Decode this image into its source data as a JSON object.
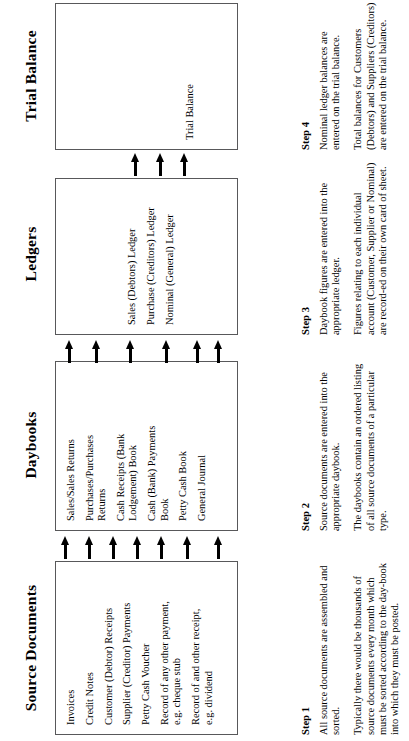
{
  "diagram": {
    "columns": [
      {
        "key": "source_documents",
        "heading": "Source Documents",
        "items": [
          "Invoices",
          "Credit Notes",
          "Customer (Debtor) Receipts",
          "Supplier (Creditor) Payments",
          "Petty Cash Voucher",
          "Record of any other payment,\ne.g. cheque stub",
          "Record of and other receipt,\ne.g. dividend"
        ],
        "step": {
          "label": "Step 1",
          "paragraphs": [
            "All source documents are assembled and sorted.",
            "Typically there would be thousands of source documents every month which must be sorted according to the day-book into which they must be posted."
          ]
        }
      },
      {
        "key": "daybooks",
        "heading": "Daybooks",
        "items": [
          "Sales/Sales Returns",
          "Purchases/Purchases\nReturns",
          "Cash Receipts (Bank\nLodgement) Book",
          "Cash (Bank) Payments\nBook",
          "Petty Cash Book",
          "General Journal"
        ],
        "step": {
          "label": "Step 2",
          "paragraphs": [
            "Source documents are entered into the appropriate daybook.",
            "The daybooks contain an ordered listing of all source documents of a particular type."
          ]
        }
      },
      {
        "key": "ledgers",
        "heading": "Ledgers",
        "items": [
          "Sales (Debtors) Ledger",
          "Purchase (Creditors) Ledger",
          "Nominal (General) Ledger"
        ],
        "step": {
          "label": "Step 3",
          "paragraphs": [
            "Daybook figures are entered into the appropriate ledger.",
            "Figures relating to each individual account (Customer, Supplier or Nominal) are record-ed on their own card of sheet."
          ]
        }
      },
      {
        "key": "trial_balance",
        "heading": "Trial Balance",
        "items": [
          "Trial Balance"
        ],
        "step": {
          "label": "Step 4",
          "paragraphs": [
            "Nominal ledger balances are entered on the trial balance.",
            "Total balances for Customers (Debtors) and Suppliers (Creditors) are entered on the trial balance."
          ]
        }
      }
    ],
    "flows": [
      {
        "key": "source-to-daybooks",
        "from": "source_documents",
        "to": "daybooks",
        "arrow_count": 7
      },
      {
        "key": "daybooks-to-ledgers",
        "from": "daybooks",
        "to": "ledgers",
        "arrow_count": 6
      },
      {
        "key": "ledgers-to-trialbalance",
        "from": "ledgers",
        "to": "trial_balance",
        "arrow_count": 3
      }
    ],
    "colors": {
      "background": "#ffffff",
      "text": "#000000",
      "box_border": "#58585a",
      "arrow": "#000000"
    }
  }
}
